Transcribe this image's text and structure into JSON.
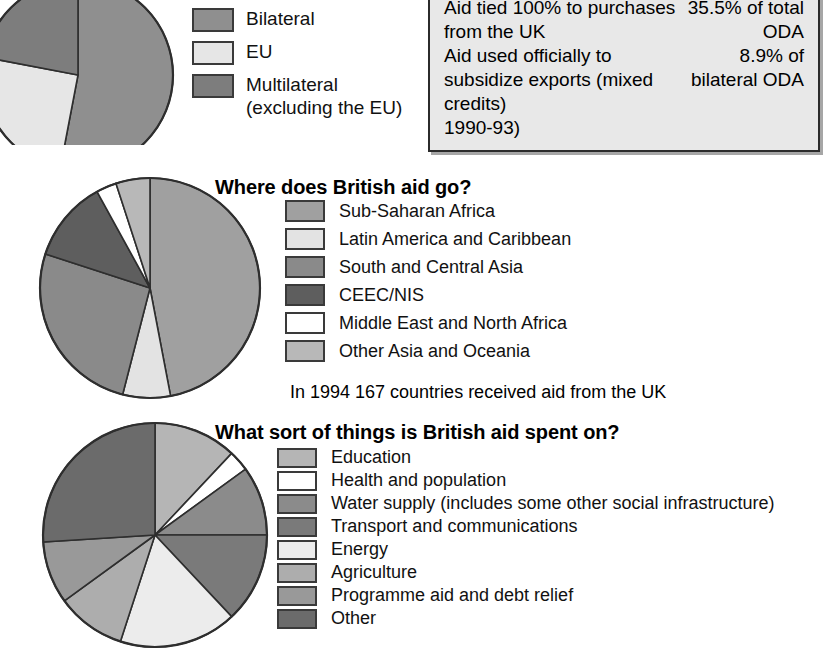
{
  "info_box": {
    "facts": [
      {
        "text": "Aid tied 100% to purchases from the UK",
        "value": "35.5% of total ODA"
      },
      {
        "text": "Aid used officially to subsidize exports (mixed credits)",
        "value": "8.9% of bilateral ODA",
        "tail": "1990-93)"
      }
    ]
  },
  "sections": [
    {
      "id": "top",
      "heading": "",
      "legend": [
        {
          "label": "Bilateral",
          "sub": "",
          "color": "#8f8f8f"
        },
        {
          "label": "EU",
          "sub": "",
          "color": "#e6e6e6"
        },
        {
          "label": "Multilateral",
          "sub": "(excluding the EU)",
          "color": "#7d7d7d"
        }
      ]
    },
    {
      "id": "mid",
      "heading": "Where does British aid go?",
      "note": "In 1994 167 countries received aid from the UK",
      "legend": [
        {
          "label": "Sub-Saharan Africa",
          "color": "#a0a0a0"
        },
        {
          "label": "Latin America and Caribbean",
          "color": "#e3e3e3"
        },
        {
          "label": "South and Central Asia",
          "color": "#8a8a8a"
        },
        {
          "label": "CEEC/NIS",
          "color": "#5e5e5e"
        },
        {
          "label": "Middle East and North Africa",
          "color": "#ffffff"
        },
        {
          "label": "Other Asia and Oceania",
          "color": "#b8b8b8"
        }
      ]
    },
    {
      "id": "bot",
      "heading": "What sort of things is British aid spent on?",
      "legend": [
        {
          "label": "Education",
          "color": "#b5b5b5"
        },
        {
          "label": "Health and population",
          "color": "#ffffff"
        },
        {
          "label": "Water supply (includes some other social infrastructure)",
          "color": "#8b8b8b"
        },
        {
          "label": "Transport and communications",
          "color": "#7a7a7a"
        },
        {
          "label": "Energy",
          "color": "#ececec"
        },
        {
          "label": "Agriculture",
          "color": "#adadad"
        },
        {
          "label": "Programme aid and debt relief",
          "color": "#999999"
        },
        {
          "label": "Other",
          "color": "#6b6b6b"
        }
      ]
    }
  ],
  "chart_data": [
    {
      "type": "pie",
      "title": "UK aid: bilateral vs multilateral",
      "labels": [
        "Bilateral",
        "EU",
        "Multilateral (excluding the EU)"
      ],
      "values": [
        53,
        25,
        22
      ],
      "colors": [
        "#8f8f8f",
        "#e6e6e6",
        "#7d7d7d"
      ],
      "start_angle": 0,
      "center": [
        78,
        75
      ],
      "radius": 95,
      "legend_position": "right",
      "note": "pie is cropped by the top and left edges of the image"
    },
    {
      "type": "pie",
      "title": "Where does British aid go?",
      "labels": [
        "Sub-Saharan Africa",
        "Latin America and Caribbean",
        "South and Central Asia",
        "CEEC/NIS",
        "Middle East and North Africa",
        "Other Asia and Oceania"
      ],
      "values": [
        47,
        7,
        26,
        12,
        3,
        5
      ],
      "colors": [
        "#a0a0a0",
        "#e3e3e3",
        "#8a8a8a",
        "#5e5e5e",
        "#ffffff",
        "#b8b8b8"
      ],
      "start_angle": 0,
      "center": [
        150,
        288
      ],
      "radius": 110,
      "legend_position": "right"
    },
    {
      "type": "pie",
      "title": "What sort of things is British aid spent on?",
      "labels": [
        "Education",
        "Health and population",
        "Water supply (includes some other social infrastructure)",
        "Transport and communications",
        "Energy",
        "Agriculture",
        "Programme aid and debt relief",
        "Other"
      ],
      "values": [
        12,
        3,
        10,
        13,
        17,
        10,
        9,
        26
      ],
      "colors": [
        "#b5b5b5",
        "#ffffff",
        "#8b8b8b",
        "#7a7a7a",
        "#ececec",
        "#adadad",
        "#999999",
        "#6b6b6b"
      ],
      "start_angle": 0,
      "center": [
        155,
        535
      ],
      "radius": 112,
      "legend_position": "right"
    }
  ]
}
